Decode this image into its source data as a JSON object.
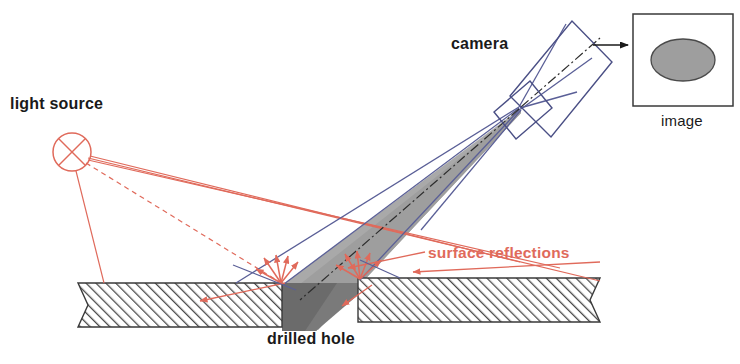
{
  "figure": {
    "type": "optical-inspection-schematic",
    "background_color": "#ffffff"
  },
  "labels": {
    "light_source": "light source",
    "camera": "camera",
    "image": "image",
    "drilled_hole": "drilled hole",
    "surface_reflections": "surface reflections"
  },
  "colors": {
    "red": "#e06a5b",
    "blue": "#5a5f97",
    "black": "#1a1a1a",
    "cone_light_gray": "#b6b6b6",
    "cone_mid_gray": "#9a9a9a",
    "hole_dark_gray": "#6e6e6e",
    "ellipse_gray": "#9e9e9e",
    "hatch_gray": "#4a4a4a"
  },
  "elements": {
    "light_source_symbol": {
      "name": "circle-with-x",
      "cx": 72,
      "cy": 152,
      "r": 19
    },
    "camera_body": {
      "name": "tilted-rectangle",
      "rotation_deg": -28
    },
    "camera_lens": {
      "name": "small-tilted-square",
      "rotation_deg": -28
    },
    "image_box": {
      "x": 633,
      "y": 14,
      "width": 100,
      "height": 92,
      "ellipse_rx": 32,
      "ellipse_ry": 21
    },
    "workpiece": {
      "left_plate": {
        "x1": 78,
        "x2": 282,
        "top": 283,
        "bottom": 327
      },
      "right_plate": {
        "x1": 358,
        "x2": 600,
        "top": 278,
        "bottom": 322
      },
      "hatch_angle_deg": 45
    },
    "hole": {
      "left": 282,
      "right": 358,
      "top": 283
    }
  }
}
